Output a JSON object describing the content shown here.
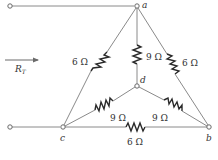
{
  "diagram": {
    "type": "circuit",
    "input_label": "R",
    "input_label_sub": "T",
    "nodes": {
      "a": {
        "label": "a"
      },
      "b": {
        "label": "b"
      },
      "c": {
        "label": "c"
      },
      "d": {
        "label": "d"
      }
    },
    "resistors": [
      {
        "id": "R_ac",
        "from": "a",
        "to": "c",
        "label": "6 Ω"
      },
      {
        "id": "R_ab",
        "from": "a",
        "to": "b",
        "label": "6 Ω"
      },
      {
        "id": "R_cb",
        "from": "c",
        "to": "b",
        "label": "6 Ω"
      },
      {
        "id": "R_ad",
        "from": "a",
        "to": "d",
        "label": "9 Ω"
      },
      {
        "id": "R_cd",
        "from": "c",
        "to": "d",
        "label": "9 Ω"
      },
      {
        "id": "R_bd",
        "from": "b",
        "to": "d",
        "label": "9 Ω"
      }
    ],
    "colors": {
      "wire": "#8a8a8a",
      "resistor": "#2a2a2a",
      "text": "#333333"
    }
  }
}
